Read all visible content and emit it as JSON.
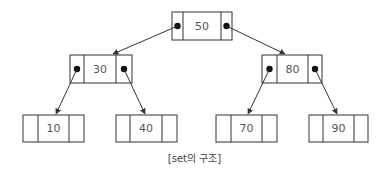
{
  "diagram": {
    "title": "set의 구조",
    "caption": "[set의 구조]",
    "type": "binary-search-tree",
    "colors": {
      "stroke": "#333333",
      "text": "#555555",
      "pointer": "#111111",
      "background": "#ffffff"
    },
    "nodes": [
      {
        "id": "n50",
        "value": "50",
        "level": 0,
        "has_left_pointer": true,
        "has_right_pointer": true
      },
      {
        "id": "n30",
        "value": "30",
        "level": 1,
        "has_left_pointer": true,
        "has_right_pointer": true
      },
      {
        "id": "n80",
        "value": "80",
        "level": 1,
        "has_left_pointer": true,
        "has_right_pointer": true
      },
      {
        "id": "n10",
        "value": "10",
        "level": 2,
        "has_left_pointer": false,
        "has_right_pointer": false
      },
      {
        "id": "n40",
        "value": "40",
        "level": 2,
        "has_left_pointer": false,
        "has_right_pointer": false
      },
      {
        "id": "n70",
        "value": "70",
        "level": 2,
        "has_left_pointer": false,
        "has_right_pointer": false
      },
      {
        "id": "n90",
        "value": "90",
        "level": 2,
        "has_left_pointer": false,
        "has_right_pointer": false
      }
    ],
    "edges": [
      {
        "from": "n50",
        "to": "n30",
        "side": "left"
      },
      {
        "from": "n50",
        "to": "n80",
        "side": "right"
      },
      {
        "from": "n30",
        "to": "n10",
        "side": "left"
      },
      {
        "from": "n30",
        "to": "n40",
        "side": "right"
      },
      {
        "from": "n80",
        "to": "n70",
        "side": "left"
      },
      {
        "from": "n80",
        "to": "n90",
        "side": "right"
      }
    ]
  }
}
